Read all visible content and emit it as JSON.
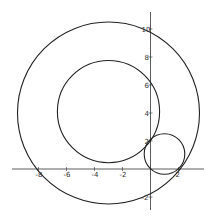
{
  "chart_data": {
    "type": "scatter",
    "title": "",
    "xlabel": "",
    "ylabel": "",
    "xlim": [
      -9.5,
      3.8
    ],
    "ylim": [
      -2.9,
      10.9
    ],
    "grid": false,
    "x_ticks": [
      -8,
      -6,
      -4,
      -2,
      2
    ],
    "y_ticks": [
      -2,
      2,
      4,
      6,
      8,
      10
    ],
    "x_tick_labels": [
      "-8",
      "-6",
      "-4",
      "-2",
      "2"
    ],
    "y_tick_labels": [
      "-2",
      "2",
      "4",
      "6",
      "8",
      "10"
    ],
    "series": [
      {
        "name": "large circle",
        "shape": "circle",
        "center": [
          -3,
          4
        ],
        "radius": 6.5
      },
      {
        "name": "medium circle",
        "shape": "circle",
        "center": [
          -3,
          4.1
        ],
        "radius": 3.65
      },
      {
        "name": "small circle",
        "shape": "circle",
        "center": [
          1.0,
          1.07
        ],
        "radius": 1.45
      }
    ]
  },
  "style": {
    "stroke": "#222222",
    "axis": "#333333"
  }
}
